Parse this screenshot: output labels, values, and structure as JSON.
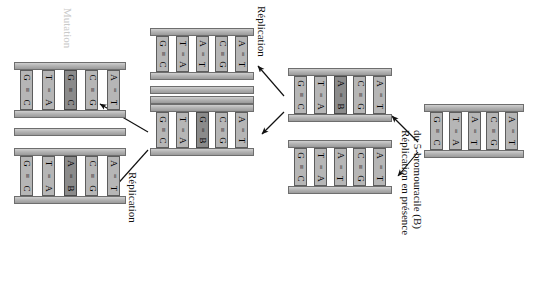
{
  "diagram": {
    "title_text": "",
    "colors": {
      "backbone": "#b4b4b4",
      "rung": "#b6b6b6",
      "rung_highlight": "#8b8b8b",
      "stroke": "#5d5d5d",
      "text": "#111111",
      "faint_text": "#c9c9c9",
      "background": "#ffffff"
    },
    "labels": [
      {
        "id": "mutation",
        "text": "Mutation",
        "style": "faint",
        "x": 74,
        "y": 8
      },
      {
        "id": "replication-top",
        "text": "Réplication",
        "style": "dark",
        "x": 268,
        "y": 6
      },
      {
        "id": "replication-bottom",
        "text": "Réplication",
        "style": "dark",
        "x": 139,
        "y": 172
      },
      {
        "id": "replication-bu-l1",
        "text": "Réplication en présence",
        "style": "dark",
        "x": 412,
        "y": 130
      },
      {
        "id": "replication-bu-l2",
        "text": "du 5-bromouracile (B)",
        "style": "dark",
        "x": 424,
        "y": 130
      }
    ],
    "molecules": [
      {
        "id": "left-top",
        "name": "mutant-duplex-GC",
        "x": 14,
        "y": 62,
        "w": 112,
        "h": 56,
        "pairs": [
          {
            "top": "G",
            "bond": "≡",
            "bottom": "C",
            "highlight": false
          },
          {
            "top": "T",
            "bond": "=",
            "bottom": "A",
            "highlight": false
          },
          {
            "top": "G",
            "bond": "≡",
            "bottom": "C",
            "highlight": true
          },
          {
            "top": "C",
            "bond": "≡",
            "bottom": "G",
            "highlight": false
          },
          {
            "top": "A",
            "bond": "=",
            "bottom": "T",
            "highlight": false
          }
        ]
      },
      {
        "id": "left-bottom",
        "name": "duplex-AB",
        "x": 14,
        "y": 148,
        "w": 112,
        "h": 56,
        "pairs": [
          {
            "top": "G",
            "bond": "≡",
            "bottom": "C",
            "highlight": false
          },
          {
            "top": "T",
            "bond": "=",
            "bottom": "A",
            "highlight": false
          },
          {
            "top": "A",
            "bond": "=",
            "bottom": "B",
            "highlight": true
          },
          {
            "top": "C",
            "bond": "≡",
            "bottom": "G",
            "highlight": false
          },
          {
            "top": "A",
            "bond": "=",
            "bottom": "T",
            "highlight": false
          }
        ]
      },
      {
        "id": "mid-top",
        "name": "duplex-normal-top",
        "x": 150,
        "y": 28,
        "w": 104,
        "h": 52,
        "pairs": [
          {
            "top": "G",
            "bond": "≡",
            "bottom": "C",
            "highlight": false
          },
          {
            "top": "T",
            "bond": "=",
            "bottom": "A",
            "highlight": false
          },
          {
            "top": "A",
            "bond": "=",
            "bottom": "T",
            "highlight": false
          },
          {
            "top": "C",
            "bond": "≡",
            "bottom": "G",
            "highlight": false
          },
          {
            "top": "A",
            "bond": "=",
            "bottom": "T",
            "highlight": false
          }
        ]
      },
      {
        "id": "mid-bottom",
        "name": "duplex-GB",
        "x": 150,
        "y": 104,
        "w": 104,
        "h": 52,
        "pairs": [
          {
            "top": "G",
            "bond": "≡",
            "bottom": "C",
            "highlight": false
          },
          {
            "top": "T",
            "bond": "=",
            "bottom": "A",
            "highlight": false
          },
          {
            "top": "G",
            "bond": "=",
            "bottom": "B",
            "highlight": true
          },
          {
            "top": "C",
            "bond": "≡",
            "bottom": "G",
            "highlight": false
          },
          {
            "top": "A",
            "bond": "=",
            "bottom": "T",
            "highlight": false
          }
        ]
      },
      {
        "id": "right-top",
        "name": "duplex-AB-right",
        "x": 288,
        "y": 68,
        "w": 104,
        "h": 54,
        "pairs": [
          {
            "top": "G",
            "bond": "≡",
            "bottom": "C",
            "highlight": false
          },
          {
            "top": "T",
            "bond": "=",
            "bottom": "A",
            "highlight": false
          },
          {
            "top": "A",
            "bond": "=",
            "bottom": "B",
            "highlight": true
          },
          {
            "top": "C",
            "bond": "≡",
            "bottom": "G",
            "highlight": false
          },
          {
            "top": "A",
            "bond": "=",
            "bottom": "T",
            "highlight": false
          }
        ]
      },
      {
        "id": "right-bottom",
        "name": "duplex-normal-right",
        "x": 288,
        "y": 140,
        "w": 104,
        "h": 54,
        "pairs": [
          {
            "top": "G",
            "bond": "≡",
            "bottom": "C",
            "highlight": false
          },
          {
            "top": "T",
            "bond": "=",
            "bottom": "A",
            "highlight": false
          },
          {
            "top": "A",
            "bond": "=",
            "bottom": "T",
            "highlight": false
          },
          {
            "top": "C",
            "bond": "≡",
            "bottom": "G",
            "highlight": false
          },
          {
            "top": "A",
            "bond": "=",
            "bottom": "T",
            "highlight": false
          }
        ]
      },
      {
        "id": "far-right",
        "name": "duplex-parent",
        "x": 424,
        "y": 104,
        "w": 100,
        "h": 54,
        "pairs": [
          {
            "top": "G",
            "bond": "≡",
            "bottom": "C",
            "highlight": false
          },
          {
            "top": "T",
            "bond": "=",
            "bottom": "A",
            "highlight": false
          },
          {
            "top": "A",
            "bond": "=",
            "bottom": "T",
            "highlight": false
          },
          {
            "top": "C",
            "bond": "≡",
            "bottom": "G",
            "highlight": false
          },
          {
            "top": "A",
            "bond": "=",
            "bottom": "T",
            "highlight": false
          }
        ]
      }
    ],
    "bare_strands": [
      {
        "id": "bare-left-gap-top",
        "name": "free-strand-upper",
        "x": 14,
        "y": 128,
        "w": 112
      },
      {
        "id": "bare-mid-upper",
        "name": "free-strand-mid-a",
        "x": 150,
        "y": 86,
        "w": 104
      },
      {
        "id": "bare-mid-lower",
        "name": "free-strand-mid-b",
        "x": 150,
        "y": 96,
        "w": 104
      }
    ],
    "arrows": [
      {
        "id": "arrow-mid-to-left-top",
        "name": "arrow-replication-left-top",
        "x1": 148,
        "y1": 132,
        "x2": 100,
        "y2": 104
      },
      {
        "id": "arrow-mid-to-left-bottom",
        "name": "arrow-replication-left-bottom",
        "x1": 148,
        "y1": 150,
        "x2": 114,
        "y2": 188
      },
      {
        "id": "arrow-right-to-mid-top",
        "name": "arrow-replication-mid-top",
        "x1": 284,
        "y1": 96,
        "x2": 258,
        "y2": 66
      },
      {
        "id": "arrow-right-to-mid-bottom",
        "name": "arrow-replication-mid-bottom",
        "x1": 284,
        "y1": 112,
        "x2": 262,
        "y2": 134
      },
      {
        "id": "arrow-parent-to-right-top",
        "name": "arrow-bu-top",
        "x1": 418,
        "y1": 142,
        "x2": 392,
        "y2": 116
      },
      {
        "id": "arrow-parent-to-right-bot",
        "name": "arrow-bu-bottom",
        "x1": 418,
        "y1": 152,
        "x2": 398,
        "y2": 176
      }
    ]
  }
}
